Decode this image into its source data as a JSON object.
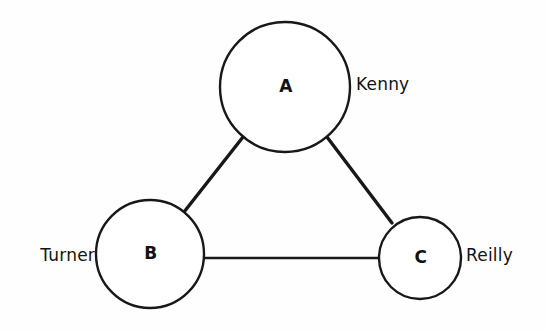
{
  "diagram": {
    "background_color": "#fefefe",
    "stroke_color": "#18181a",
    "nodes": [
      {
        "id": "A",
        "letter": "A",
        "label": "Kenny",
        "label_side": "right",
        "cx": 285,
        "cy": 87,
        "r": 65
      },
      {
        "id": "B",
        "letter": "B",
        "label": "Turner",
        "label_side": "left",
        "cx": 150,
        "cy": 254,
        "r": 54
      },
      {
        "id": "C",
        "letter": "C",
        "label": "Reilly",
        "label_side": "right",
        "cx": 420,
        "cy": 258,
        "r": 41
      }
    ],
    "edges": [
      {
        "id": "AB",
        "from": "A",
        "to": "B",
        "x1": 243,
        "y1": 137,
        "x2": 184,
        "y2": 212,
        "kind": "diagonal"
      },
      {
        "id": "AC",
        "from": "A",
        "to": "C",
        "x1": 327,
        "y1": 137,
        "x2": 392,
        "y2": 223,
        "kind": "diagonal"
      },
      {
        "id": "BC",
        "from": "B",
        "to": "C",
        "x1": 203,
        "y1": 258,
        "x2": 380,
        "y2": 258,
        "kind": "horizontal"
      }
    ],
    "label_positions": {
      "kenny": {
        "x": 356,
        "y": 85
      },
      "turner": {
        "x": 95,
        "y": 256
      },
      "reilly": {
        "x": 466,
        "y": 256
      }
    }
  }
}
